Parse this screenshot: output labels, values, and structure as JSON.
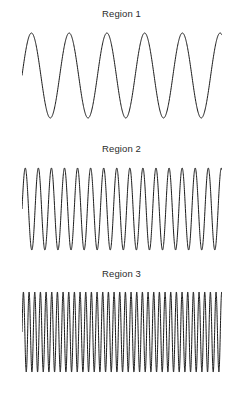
{
  "figure": {
    "background_color": "#ffffff",
    "width": 243,
    "height": 397,
    "stroke_color": "#1a1a1a",
    "title_color": "#2b2b2b"
  },
  "panels": [
    {
      "title": "Region 1",
      "title_top": 8,
      "plot_top": 28,
      "plot_height": 96,
      "plot_left": 22,
      "plot_width": 200,
      "wave_top": 33,
      "wave_bottom": 118
    },
    {
      "title": "Region 2",
      "title_top": 143,
      "plot_top": 163,
      "plot_height": 94,
      "plot_left": 22,
      "plot_width": 200,
      "wave_top": 168,
      "wave_bottom": 250
    },
    {
      "title": "Region 3",
      "title_top": 268,
      "plot_top": 288,
      "plot_height": 92,
      "plot_left": 22,
      "plot_width": 200,
      "wave_top": 292,
      "wave_bottom": 372
    }
  ],
  "chart_data": {
    "type": "line",
    "title": "",
    "xlabel": "",
    "ylabel": "",
    "grid": false,
    "legend": "none",
    "axes_visible": false,
    "tick_labels": [],
    "panels": [
      {
        "title": "Region 1",
        "waveform": "sine",
        "cycles": 5.3,
        "amplitude": 1.0,
        "phase": 0.0,
        "x_range": [
          0,
          5.3
        ],
        "ylim": [
          -1.15,
          1.15
        ],
        "samples": 800
      },
      {
        "title": "Region 2",
        "waveform": "sine",
        "cycles": 15.3,
        "amplitude": 1.0,
        "phase": 0.0,
        "x_range": [
          0,
          15.3
        ],
        "ylim": [
          -1.15,
          1.15
        ],
        "samples": 1600
      },
      {
        "title": "Region 3",
        "waveform": "sine",
        "cycles": 35.3,
        "amplitude": 1.0,
        "phase": 0.0,
        "x_range": [
          0,
          35.3
        ],
        "ylim": [
          -1.15,
          1.15
        ],
        "samples": 3200
      }
    ]
  }
}
